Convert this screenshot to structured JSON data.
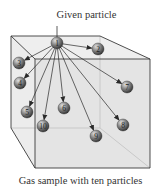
{
  "title_label": "Given particle",
  "caption": "Gas sample with ten particles",
  "colors": {
    "box_edge": "#3a3a3a",
    "box_face": "#e9e9e9",
    "box_face_front": "#e2e2e2",
    "sphere_light": "#d8d8d8",
    "sphere_dark": "#3c3c3c",
    "arrow": "#2a2a2a"
  },
  "given_particle": {
    "id": "1",
    "x": 57,
    "y": 43
  },
  "particles": [
    {
      "id": "2",
      "x": 98,
      "y": 49
    },
    {
      "id": "3",
      "x": 19,
      "y": 63
    },
    {
      "id": "4",
      "x": 20,
      "y": 83
    },
    {
      "id": "5",
      "x": 27,
      "y": 112
    },
    {
      "id": "6",
      "x": 64,
      "y": 108
    },
    {
      "id": "7",
      "x": 127,
      "y": 87
    },
    {
      "id": "8",
      "x": 123,
      "y": 125
    },
    {
      "id": "9",
      "x": 96,
      "y": 136
    },
    {
      "id": "10",
      "x": 43,
      "y": 126
    }
  ]
}
